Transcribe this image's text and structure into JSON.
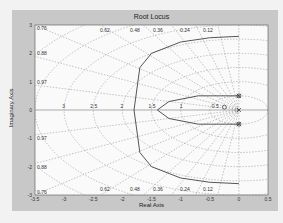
{
  "chart_data": {
    "type": "line",
    "title": "Root Locus",
    "xlabel": "Real Axis",
    "ylabel": "Imaginary Axis",
    "xlim": [
      -3.5,
      0.5
    ],
    "ylim": [
      -3,
      3
    ],
    "xticks": [
      "-3.5",
      "-3",
      "-2.5",
      "-2",
      "-1.5",
      "-1",
      "-0.5",
      "0",
      "0.5"
    ],
    "yticks": [
      "3",
      "2",
      "1",
      "0",
      "-1",
      "-2",
      "-3"
    ],
    "grid": true,
    "damping_labels": [
      "0.76",
      "0.88",
      "0.97",
      "0.97",
      "0.88",
      "0.76",
      "0.62",
      "0.48",
      "0.36",
      "0.24",
      "0.12"
    ],
    "frequency_labels": [
      "3",
      "2.5",
      "2",
      "1.5",
      "1",
      "0.5"
    ],
    "poles": [
      [
        0,
        0
      ],
      [
        0,
        0.5
      ],
      [
        0,
        -0.5
      ]
    ],
    "zeros": [
      [
        0,
        0.5
      ],
      [
        0,
        -0.5
      ],
      [
        -0.25,
        0.1
      ]
    ],
    "series": [
      {
        "name": "branch-upper",
        "x": [
          0,
          -0.5,
          -1,
          -1.5,
          -1.7,
          -1.8
        ],
        "y": [
          2.6,
          2.55,
          2.4,
          2.0,
          1.5,
          0
        ]
      },
      {
        "name": "branch-lower",
        "x": [
          0,
          -0.5,
          -1,
          -1.5,
          -1.7,
          -1.8
        ],
        "y": [
          -2.6,
          -2.55,
          -2.4,
          -2.0,
          -1.5,
          0
        ]
      },
      {
        "name": "branch-inner",
        "x": [
          0,
          -0.7,
          -1.2,
          -1.4,
          -1.2,
          -0.7,
          0
        ],
        "y": [
          0.5,
          0.5,
          0.3,
          0,
          -0.3,
          -0.5,
          -0.5
        ]
      }
    ]
  }
}
